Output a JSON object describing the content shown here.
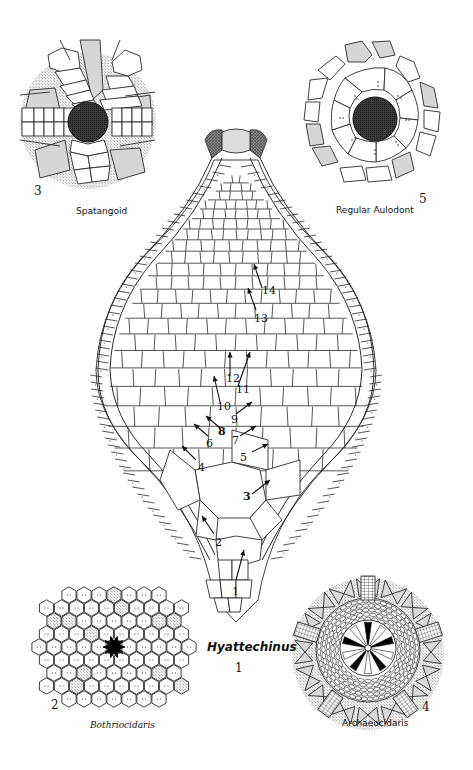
{
  "figure": {
    "main": {
      "genus": "Hyattechinus",
      "number": "1",
      "plate_sequence_labels": [
        "1",
        "2",
        "3",
        "4",
        "5",
        "6",
        "7",
        "8",
        "9",
        "10",
        "11",
        "12",
        "13",
        "14"
      ]
    },
    "insets": [
      {
        "position": "top-left",
        "number": "3",
        "label": "Spatangoid"
      },
      {
        "position": "top-right",
        "number": "5",
        "label": "Regular Aulodont"
      },
      {
        "position": "bottom-left",
        "number": "2",
        "label": "Bothriocidaris"
      },
      {
        "position": "bottom-right",
        "number": "4",
        "label": "Archaeocidaris"
      }
    ],
    "colors": {
      "line": "#2a2a2a",
      "plate_fill": "#ffffff",
      "shaded_fill": "#d9d9d9",
      "stipple_bg": "#e6e6e6",
      "peristome_dark": "#2b2b2b",
      "black": "#000000"
    }
  }
}
